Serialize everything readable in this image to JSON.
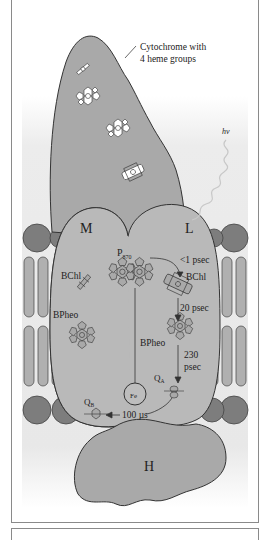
{
  "figure": {
    "labels": {
      "cytochrome": [
        "Cytochrome with",
        "4 heme groups"
      ],
      "light": "hν",
      "subunit_m": "M",
      "subunit_l": "L",
      "subunit_h": "H",
      "p870_main": "P",
      "p870_sub": "870",
      "bchl_m": "BChl",
      "bchl_l": "BChl",
      "bpheo_m": "BPheo",
      "bpheo_l": "BPheo",
      "fe": "Fe",
      "qa_main": "Q",
      "qa_sub": "A",
      "qb_main": "Q",
      "qb_sub": "B",
      "t1": "<1 psec",
      "t2": "20 psec",
      "t3a": "230",
      "t3b": "psec",
      "t4": "100 µs"
    },
    "colors": {
      "protein": "#a9a9a9",
      "protein_light": "#b9b9b9",
      "lipid_head": "#7d7d7d",
      "lipid_tail": "#b0b0b0",
      "outline": "#444444",
      "membrane_band": "#e4e4e4"
    }
  }
}
